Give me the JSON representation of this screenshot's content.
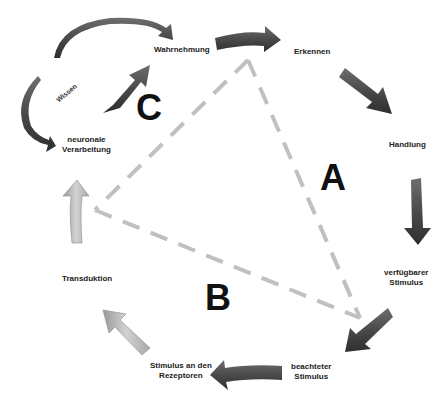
{
  "diagram": {
    "title": "",
    "nodes": {
      "wahrnehmung": "Wahrnehmung",
      "erkennen": "Erkennen",
      "handlung": "Handlung",
      "verfuegbarer_stimulus_1": "verfügbarer",
      "verfuegbarer_stimulus_2": "Stimulus",
      "beachteter_stimulus_1": "beachteter",
      "beachteter_stimulus_2": "Stimulus",
      "stimulus_rezeptoren_1": "Stimulus an den",
      "stimulus_rezeptoren_2": "Rezeptoren",
      "transduktion": "Transduktion",
      "neuronale_1": "neuronale",
      "neuronale_2": "Verarbeitung",
      "wissen": "Wissen"
    },
    "region_labels": {
      "a": "A",
      "b": "B",
      "c": "C"
    },
    "colors": {
      "dark_arrow": "#5a5a5a",
      "light_arrow": "#b8b8b8",
      "dashed_line": "#bdbdbd",
      "text": "#222222"
    }
  }
}
